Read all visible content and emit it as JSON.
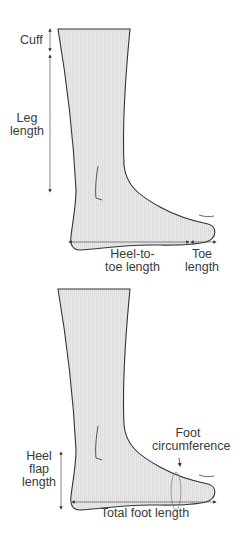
{
  "diagram1": {
    "cuff": "Cuff",
    "leg_length_line1": "Leg",
    "leg_length_line2": "length",
    "heel_to_toe_line1": "Heel-to-",
    "heel_to_toe_line2": "toe length",
    "toe_length_line1": "Toe",
    "toe_length_line2": "length"
  },
  "diagram2": {
    "foot_circ_line1": "Foot",
    "foot_circ_line2": "circumference",
    "heel_flap_line1": "Heel",
    "heel_flap_line2": "flap",
    "heel_flap_line3": "length",
    "total_foot_length": "Total foot length"
  },
  "colors": {
    "sock_fill": "#e6e6e6",
    "outline": "#333333",
    "arrow": "#333333"
  }
}
